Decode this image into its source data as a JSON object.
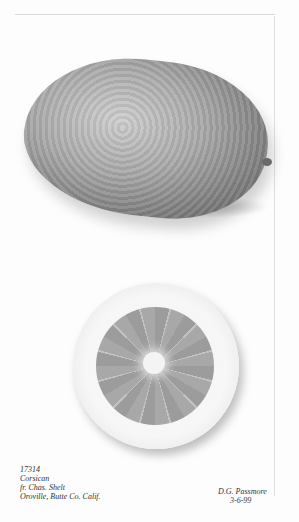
{
  "image": {
    "subject": "Botanical watercolor of a citron fruit, whole and cross-section",
    "whole_fruit": "citron-whole",
    "cross_section": "citron-slice",
    "colors": {
      "paper": "#fdfdfd",
      "fruit_mid": "#a9a9a9",
      "fruit_dark": "#5c5c5c"
    }
  },
  "inscription_left": {
    "line1": "17314",
    "line2": "Corsican",
    "line3": "fr. Chas. Shelt",
    "line4": "Oroville, Butte Co. Calif."
  },
  "inscription_right": {
    "artist": "D.G. Passmore",
    "date": "3-6-99"
  }
}
